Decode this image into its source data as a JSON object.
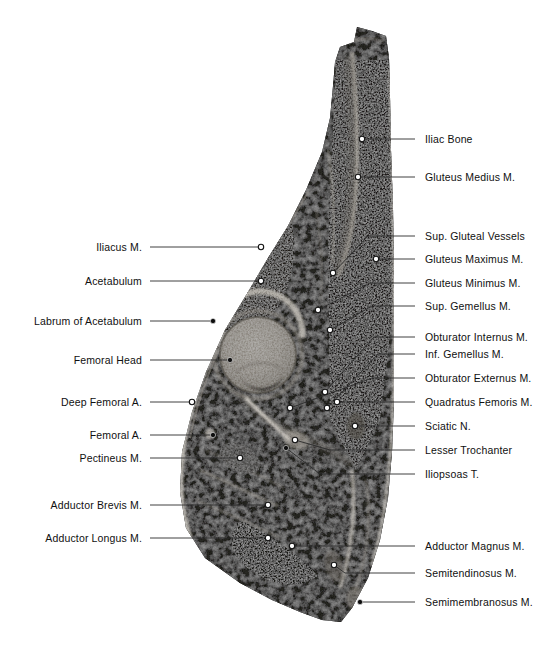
{
  "figure": {
    "kind": "anatomical-cross-section",
    "region": "hip",
    "plane": "coronal",
    "background_color": "#ffffff",
    "text_color": "#101010",
    "leader_color": "#2b2b2b",
    "width": 560,
    "height": 656
  },
  "labels_left": [
    {
      "text": "Iliacus M.",
      "text_x": 142,
      "text_y": 247,
      "line": [
        [
          150,
          247
        ],
        [
          261,
          247
        ]
      ],
      "marker": "open",
      "marker_x": 261,
      "marker_y": 247
    },
    {
      "text": "Acetabulum",
      "text_x": 142,
      "text_y": 281,
      "line": [
        [
          150,
          281
        ],
        [
          261,
          281
        ]
      ],
      "marker": "open",
      "marker_x": 261,
      "marker_y": 281
    },
    {
      "text": "Labrum of Acetabulum",
      "text_x": 142,
      "text_y": 321,
      "line": [
        [
          150,
          321
        ],
        [
          213,
          321
        ]
      ],
      "marker": "filled",
      "marker_x": 213,
      "marker_y": 321
    },
    {
      "text": "Femoral Head",
      "text_x": 142,
      "text_y": 360,
      "line": [
        [
          150,
          360
        ],
        [
          230,
          360
        ]
      ],
      "marker": "filled",
      "marker_x": 230,
      "marker_y": 360
    },
    {
      "text": "Deep Femoral A.",
      "text_x": 142,
      "text_y": 402,
      "line": [
        [
          150,
          402
        ],
        [
          192,
          402
        ]
      ],
      "marker": "open",
      "marker_x": 192,
      "marker_y": 402
    },
    {
      "text": "Femoral A.",
      "text_x": 142,
      "text_y": 435,
      "line": [
        [
          150,
          435
        ],
        [
          213,
          435
        ]
      ],
      "marker": "filled",
      "marker_x": 213,
      "marker_y": 435
    },
    {
      "text": "Pectineus M.",
      "text_x": 142,
      "text_y": 458,
      "line": [
        [
          150,
          458
        ],
        [
          240,
          458
        ]
      ],
      "marker": "open",
      "marker_x": 240,
      "marker_y": 458
    },
    {
      "text": "Adductor Brevis M.",
      "text_x": 142,
      "text_y": 505,
      "line": [
        [
          150,
          505
        ],
        [
          268,
          505
        ]
      ],
      "marker": "open",
      "marker_x": 268,
      "marker_y": 505
    },
    {
      "text": "Adductor Longus M.",
      "text_x": 142,
      "text_y": 538,
      "line": [
        [
          150,
          538
        ],
        [
          268,
          538
        ]
      ],
      "marker": "open",
      "marker_x": 268,
      "marker_y": 538
    }
  ],
  "labels_right": [
    {
      "text": "Sup. Gluteal Vessels",
      "text_x": 425,
      "text_y": 236,
      "line": [
        [
          415,
          236
        ],
        [
          368,
          236
        ],
        [
          333,
          273
        ]
      ],
      "marker": "open",
      "marker_x": 333,
      "marker_y": 273
    },
    {
      "text": "Iliac Bone",
      "text_x": 425,
      "text_y": 139,
      "line": [
        [
          415,
          139
        ],
        [
          362,
          139
        ]
      ],
      "marker": "open",
      "marker_x": 362,
      "marker_y": 139
    },
    {
      "text": "Gluteus Medius M.",
      "text_x": 425,
      "text_y": 177,
      "line": [
        [
          415,
          177
        ],
        [
          358,
          177
        ]
      ],
      "marker": "open",
      "marker_x": 358,
      "marker_y": 177
    },
    {
      "text": "Gluteus Maximus M.",
      "text_x": 425,
      "text_y": 259,
      "line": [
        [
          415,
          259
        ],
        [
          376,
          259
        ]
      ],
      "marker": "open",
      "marker_x": 376,
      "marker_y": 259
    },
    {
      "text": "Gluteus Minimus M.",
      "text_x": 425,
      "text_y": 283,
      "line": [
        [
          415,
          283
        ],
        [
          370,
          283
        ],
        [
          318,
          310
        ]
      ],
      "marker": "open",
      "marker_x": 318,
      "marker_y": 310
    },
    {
      "text": "Sup. Gemellus M.",
      "text_x": 425,
      "text_y": 306,
      "line": [
        [
          415,
          306
        ],
        [
          372,
          306
        ],
        [
          330,
          330
        ]
      ],
      "marker": "open",
      "marker_x": 330,
      "marker_y": 330
    },
    {
      "text": "Obturator Internus M.",
      "text_x": 425,
      "text_y": 337,
      "line": [
        [
          415,
          337
        ],
        [
          374,
          337
        ],
        [
          325,
          392
        ]
      ],
      "marker": "open",
      "marker_x": 325,
      "marker_y": 392
    },
    {
      "text": "Obturator Externus M.",
      "text_x": 425,
      "text_y": 378,
      "line": [
        [
          415,
          378
        ],
        [
          372,
          378
        ],
        [
          290,
          408
        ]
      ],
      "marker": "open",
      "marker_x": 290,
      "marker_y": 408
    },
    {
      "text": "Inf. Gemellus M.",
      "text_x": 425,
      "text_y": 354,
      "line": [
        [
          415,
          354
        ],
        [
          378,
          354
        ],
        [
          327,
          408
        ]
      ],
      "marker": "open",
      "marker_x": 327,
      "marker_y": 408
    },
    {
      "text": "Quadratus Femoris M.",
      "text_x": 425,
      "text_y": 402,
      "line": [
        [
          415,
          402
        ],
        [
          337,
          402
        ]
      ],
      "marker": "open",
      "marker_x": 337,
      "marker_y": 402
    },
    {
      "text": "Sciatic N.",
      "text_x": 425,
      "text_y": 426,
      "line": [
        [
          415,
          426
        ],
        [
          355,
          426
        ]
      ],
      "marker": "open",
      "marker_x": 355,
      "marker_y": 426
    },
    {
      "text": "Lesser Trochanter",
      "text_x": 425,
      "text_y": 450,
      "line": [
        [
          415,
          450
        ],
        [
          330,
          450
        ],
        [
          295,
          440
        ]
      ],
      "marker": "open",
      "marker_x": 295,
      "marker_y": 440
    },
    {
      "text": "Iliopsoas T.",
      "text_x": 425,
      "text_y": 474,
      "line": [
        [
          415,
          474
        ],
        [
          320,
          474
        ],
        [
          286,
          448
        ]
      ],
      "marker": "filled",
      "marker_x": 286,
      "marker_y": 448
    },
    {
      "text": "Adductor Magnus M.",
      "text_x": 425,
      "text_y": 546,
      "line": [
        [
          415,
          546
        ],
        [
          292,
          546
        ]
      ],
      "marker": "open",
      "marker_x": 292,
      "marker_y": 546
    },
    {
      "text": "Semitendinosus M.",
      "text_x": 425,
      "text_y": 573,
      "line": [
        [
          415,
          573
        ],
        [
          345,
          573
        ],
        [
          334,
          565
        ]
      ],
      "marker": "open",
      "marker_x": 334,
      "marker_y": 565
    },
    {
      "text": "Semimembranosus M.",
      "text_x": 425,
      "text_y": 602,
      "line": [
        [
          415,
          602
        ],
        [
          360,
          602
        ]
      ],
      "marker": "filled",
      "marker_x": 360,
      "marker_y": 602
    }
  ],
  "specimen": {
    "description": "Grayscale coronal section of hip showing ilium, acetabulum, femoral head and surrounding musculature",
    "femoral_head": {
      "cx": 258,
      "cy": 355,
      "r": 38
    }
  }
}
